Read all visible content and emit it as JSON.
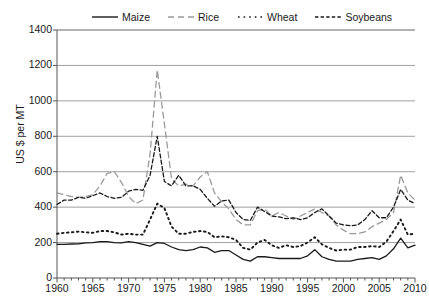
{
  "chart_data": {
    "type": "line",
    "title": "",
    "xlabel": "",
    "ylabel": "US $ per MT",
    "xlim": [
      1960,
      2010
    ],
    "ylim": [
      0,
      1400
    ],
    "yticks": [
      0,
      200,
      400,
      600,
      800,
      1000,
      1200,
      1400
    ],
    "xticks": [
      1960,
      1965,
      1970,
      1975,
      1980,
      1985,
      1990,
      1995,
      2000,
      2005,
      2010
    ],
    "grid": "horizontal",
    "legend_position": "top",
    "x": [
      1960,
      1961,
      1962,
      1963,
      1964,
      1965,
      1966,
      1967,
      1968,
      1969,
      1970,
      1971,
      1972,
      1973,
      1974,
      1975,
      1976,
      1977,
      1978,
      1979,
      1980,
      1981,
      1982,
      1983,
      1984,
      1985,
      1986,
      1987,
      1988,
      1989,
      1990,
      1991,
      1992,
      1993,
      1994,
      1995,
      1996,
      1997,
      1998,
      1999,
      2000,
      2001,
      2002,
      2003,
      2004,
      2005,
      2006,
      2007,
      2008,
      2009,
      2010
    ],
    "series": [
      {
        "name": "Maize",
        "style": "solid",
        "color": "#1a1a1a",
        "values": [
          190,
          190,
          192,
          193,
          198,
          200,
          205,
          205,
          200,
          198,
          205,
          200,
          190,
          180,
          200,
          195,
          175,
          160,
          155,
          160,
          175,
          170,
          145,
          155,
          155,
          130,
          105,
          95,
          120,
          120,
          115,
          110,
          110,
          110,
          110,
          125,
          160,
          120,
          105,
          95,
          95,
          95,
          105,
          110,
          115,
          105,
          125,
          165,
          225,
          170,
          185
        ]
      },
      {
        "name": "Rice",
        "style": "dashed",
        "color": "#9a9a9a",
        "values": [
          480,
          470,
          460,
          455,
          460,
          470,
          520,
          590,
          600,
          540,
          460,
          420,
          440,
          700,
          1175,
          870,
          560,
          520,
          530,
          520,
          570,
          600,
          480,
          430,
          390,
          330,
          300,
          300,
          380,
          390,
          350,
          370,
          350,
          330,
          350,
          370,
          390,
          370,
          350,
          300,
          270,
          250,
          250,
          260,
          290,
          310,
          330,
          370,
          580,
          480,
          440
        ]
      },
      {
        "name": "Wheat",
        "style": "dotted",
        "color": "#1a1a1a",
        "values": [
          250,
          255,
          258,
          262,
          258,
          255,
          265,
          265,
          258,
          245,
          250,
          245,
          245,
          330,
          420,
          395,
          290,
          250,
          250,
          260,
          265,
          260,
          230,
          235,
          230,
          215,
          170,
          160,
          200,
          215,
          185,
          170,
          185,
          175,
          180,
          200,
          230,
          190,
          170,
          155,
          160,
          160,
          175,
          175,
          180,
          175,
          205,
          265,
          330,
          245,
          250
        ]
      },
      {
        "name": "Soybeans",
        "style": "dashdot",
        "color": "#1a1a1a",
        "values": [
          415,
          440,
          440,
          455,
          450,
          465,
          480,
          460,
          450,
          455,
          490,
          500,
          495,
          580,
          800,
          545,
          520,
          580,
          520,
          520,
          500,
          450,
          405,
          435,
          440,
          370,
          330,
          325,
          400,
          375,
          350,
          345,
          335,
          340,
          330,
          340,
          370,
          390,
          350,
          310,
          300,
          295,
          300,
          330,
          380,
          340,
          340,
          400,
          500,
          440,
          420
        ]
      }
    ]
  },
  "legend": {
    "items": [
      {
        "label": "Maize"
      },
      {
        "label": "Rice"
      },
      {
        "label": "Wheat"
      },
      {
        "label": "Soybeans"
      }
    ]
  },
  "axes": {
    "y_label": "US $ per MT",
    "y_tick_labels": [
      "1400",
      "1200",
      "1000",
      "800",
      "600",
      "400",
      "200",
      "0"
    ],
    "x_tick_labels": [
      "1960",
      "1965",
      "1970",
      "1975",
      "1980",
      "1985",
      "1990",
      "1995",
      "2000",
      "2005",
      "2010"
    ]
  },
  "colors": {
    "axis": "#555555",
    "grid": "#888888",
    "ink": "#1a1a1a",
    "rice": "#9a9a9a",
    "background": "#ffffff"
  }
}
